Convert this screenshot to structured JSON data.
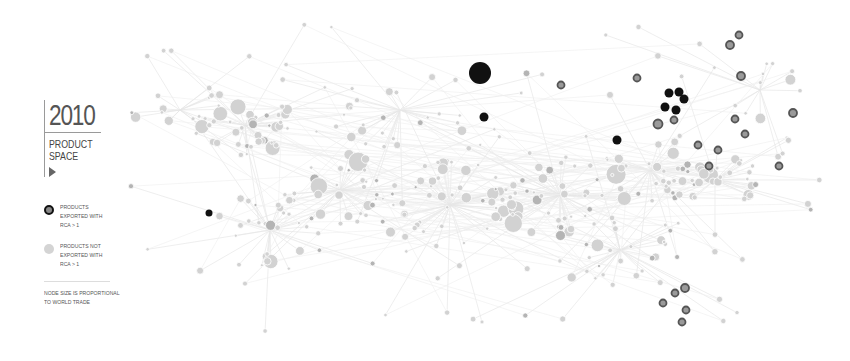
{
  "header": {
    "year": "2010",
    "title_line1": "PRODUCT",
    "title_line2": "SPACE",
    "play_icon": "play-triangle-icon"
  },
  "legend": {
    "items": [
      {
        "label": "PRODUCTS EXPORTED WITH RCA > 1",
        "swatch": "dark-ring"
      },
      {
        "label": "PRODUCTS NOT EXPORTED WITH RCA > 1",
        "swatch": "light-gray"
      }
    ],
    "note": "NODE SIZE IS PROPORTIONAL TO WORLD TRADE"
  },
  "colors": {
    "background": "#ffffff",
    "edge": "#e6e6e6",
    "node_gray": "#d2d2d2",
    "node_mid": "#b4b4b4",
    "node_dark": "#111111",
    "ring_stroke": "#555555",
    "text": "#555555"
  },
  "graph": {
    "highlighted_nodes": [
      {
        "x": 480,
        "y": 73,
        "r": 11,
        "type": "dark"
      },
      {
        "x": 484,
        "y": 117,
        "r": 4.5,
        "type": "dark"
      },
      {
        "x": 669,
        "y": 93,
        "r": 4.5,
        "type": "dark"
      },
      {
        "x": 679,
        "y": 92,
        "r": 4.5,
        "type": "dark"
      },
      {
        "x": 684,
        "y": 99,
        "r": 4.5,
        "type": "dark"
      },
      {
        "x": 665,
        "y": 107,
        "r": 4.5,
        "type": "dark"
      },
      {
        "x": 676,
        "y": 110,
        "r": 4.5,
        "type": "dark"
      },
      {
        "x": 617,
        "y": 140,
        "r": 4.5,
        "type": "dark"
      },
      {
        "x": 209,
        "y": 213,
        "r": 3.5,
        "type": "dark"
      },
      {
        "x": 739,
        "y": 35,
        "r": 3.5,
        "type": "ring"
      },
      {
        "x": 730,
        "y": 45,
        "r": 4,
        "type": "ring"
      },
      {
        "x": 741,
        "y": 76,
        "r": 4,
        "type": "ring"
      },
      {
        "x": 793,
        "y": 113,
        "r": 4,
        "type": "ring"
      },
      {
        "x": 658,
        "y": 124,
        "r": 4.5,
        "type": "ring"
      },
      {
        "x": 674,
        "y": 120,
        "r": 3.5,
        "type": "ring"
      },
      {
        "x": 735,
        "y": 119,
        "r": 3.5,
        "type": "ring"
      },
      {
        "x": 745,
        "y": 134,
        "r": 3.5,
        "type": "ring"
      },
      {
        "x": 718,
        "y": 150,
        "r": 3.5,
        "type": "ring"
      },
      {
        "x": 698,
        "y": 145,
        "r": 3.5,
        "type": "ring"
      },
      {
        "x": 637,
        "y": 78,
        "r": 3.5,
        "type": "ring"
      },
      {
        "x": 561,
        "y": 85,
        "r": 3.5,
        "type": "ring"
      },
      {
        "x": 709,
        "y": 166,
        "r": 3.5,
        "type": "ring"
      },
      {
        "x": 779,
        "y": 166,
        "r": 3.5,
        "type": "ring"
      },
      {
        "x": 685,
        "y": 288,
        "r": 4,
        "type": "ring"
      },
      {
        "x": 675,
        "y": 293,
        "r": 3.5,
        "type": "ring"
      },
      {
        "x": 663,
        "y": 303,
        "r": 3.5,
        "type": "ring"
      },
      {
        "x": 686,
        "y": 310,
        "r": 3.5,
        "type": "ring"
      },
      {
        "x": 682,
        "y": 322,
        "r": 3.5,
        "type": "ring"
      }
    ],
    "hubs": [
      {
        "x": 245,
        "y": 125,
        "r": 40,
        "count": 32
      },
      {
        "x": 340,
        "y": 190,
        "r": 50,
        "count": 30
      },
      {
        "x": 450,
        "y": 205,
        "r": 60,
        "count": 42
      },
      {
        "x": 560,
        "y": 195,
        "r": 55,
        "count": 38
      },
      {
        "x": 650,
        "y": 170,
        "r": 45,
        "count": 30
      },
      {
        "x": 715,
        "y": 180,
        "r": 38,
        "count": 26
      },
      {
        "x": 270,
        "y": 230,
        "r": 55,
        "count": 24
      },
      {
        "x": 620,
        "y": 250,
        "r": 60,
        "count": 24
      },
      {
        "x": 400,
        "y": 110,
        "r": 60,
        "count": 20
      },
      {
        "x": 180,
        "y": 110,
        "r": 40,
        "count": 14
      },
      {
        "x": 760,
        "y": 90,
        "r": 40,
        "count": 10
      }
    ]
  }
}
